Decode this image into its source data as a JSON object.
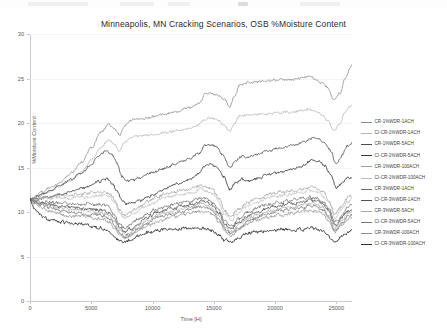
{
  "chart_data": {
    "type": "line",
    "title": "Minneapolis, MN Cracking Scenarios, OSB %Moisture Content",
    "xlabel": "Time [H]",
    "ylabel": "%Moisture Content",
    "xlim": [
      0,
      26280
    ],
    "ylim": [
      0,
      30
    ],
    "xticks": [
      0,
      5000,
      10000,
      15000,
      20000,
      25000
    ],
    "yticks": [
      0,
      5,
      10,
      15,
      20,
      25,
      30
    ],
    "grid": true,
    "legend_position": "right",
    "series": [
      {
        "name": "CR-1%WDR-1ACH",
        "color": "#8a8a8a",
        "width": 0.75,
        "x": [
          0,
          500,
          1000,
          1800,
          2600,
          3400,
          4200,
          5000,
          5800,
          6400,
          6900,
          7300,
          7700,
          8100,
          8600,
          9200,
          10000,
          11000,
          12000,
          13000,
          13800,
          14300,
          14800,
          15300,
          15800,
          16300,
          16700,
          17100,
          17600,
          18200,
          19000,
          20000,
          21000,
          22000,
          22800,
          23300,
          23800,
          24300,
          24800,
          25300,
          25700,
          26100,
          26280
        ],
        "values": [
          11.4,
          11.8,
          12.2,
          12.8,
          13.5,
          14.4,
          15.6,
          17.2,
          19.0,
          19.8,
          19.3,
          18.6,
          19.6,
          20.2,
          20.4,
          20.5,
          20.7,
          21.0,
          21.3,
          21.7,
          22.2,
          23.2,
          23.4,
          23.2,
          22.6,
          21.9,
          23.0,
          24.2,
          24.5,
          24.6,
          24.7,
          24.8,
          24.9,
          25.0,
          25.2,
          24.9,
          24.5,
          23.9,
          22.6,
          23.4,
          25.0,
          26.1,
          26.5
        ]
      },
      {
        "name": "CI-CR-1%WDR-1ACH",
        "color": "#b4b4b4",
        "width": 0.75,
        "x": [
          0,
          500,
          1000,
          1800,
          2600,
          3400,
          4200,
          5000,
          5800,
          6400,
          6900,
          7300,
          7700,
          8100,
          8600,
          9200,
          10000,
          11000,
          12000,
          13000,
          13800,
          14300,
          14800,
          15300,
          15800,
          16300,
          16700,
          17100,
          17600,
          18200,
          19000,
          20000,
          21000,
          22000,
          22800,
          23300,
          23800,
          24300,
          24800,
          25300,
          25700,
          26100,
          26280
        ],
        "values": [
          11.4,
          11.7,
          12.0,
          12.4,
          13.0,
          13.6,
          14.5,
          15.8,
          17.3,
          18.1,
          17.6,
          16.9,
          17.7,
          18.3,
          18.5,
          18.6,
          18.7,
          18.9,
          19.1,
          19.4,
          19.8,
          20.4,
          20.6,
          20.4,
          19.8,
          19.1,
          19.9,
          20.7,
          20.9,
          21.0,
          21.0,
          21.1,
          21.2,
          21.3,
          21.6,
          21.3,
          20.9,
          20.3,
          19.2,
          20.0,
          21.2,
          21.9,
          22.1
        ]
      },
      {
        "name": "CR-1%WDR-5ACH",
        "color": "#4d4d4d",
        "width": 0.8,
        "x": [
          0,
          500,
          1000,
          1800,
          2600,
          3400,
          4200,
          5000,
          5600,
          6200,
          6700,
          7100,
          7500,
          7900,
          8400,
          9000,
          10000,
          11000,
          12000,
          13000,
          13800,
          14300,
          14800,
          15300,
          15800,
          16300,
          16800,
          17300,
          17900,
          18600,
          19500,
          20500,
          21500,
          22400,
          23000,
          23500,
          24000,
          24500,
          25000,
          25500,
          25900,
          26280
        ],
        "values": [
          11.4,
          11.7,
          12.0,
          12.5,
          13.1,
          13.7,
          14.4,
          15.3,
          16.2,
          16.9,
          16.5,
          15.4,
          14.0,
          13.5,
          13.6,
          13.9,
          14.4,
          15.0,
          15.5,
          16.0,
          16.6,
          17.5,
          17.6,
          17.2,
          16.3,
          15.0,
          15.8,
          16.3,
          16.2,
          16.5,
          16.9,
          17.2,
          17.5,
          17.9,
          18.4,
          18.3,
          17.9,
          17.0,
          15.3,
          16.4,
          17.4,
          17.7
        ]
      },
      {
        "name": "CI-CR-1%WDR-5ACH",
        "color": "#3a3a3a",
        "width": 0.85,
        "x": [
          0,
          500,
          1000,
          1800,
          2600,
          3400,
          4200,
          5000,
          5600,
          6200,
          6700,
          7100,
          7500,
          7900,
          8400,
          9000,
          10000,
          11000,
          12000,
          13000,
          13800,
          14300,
          14800,
          15300,
          15800,
          16300,
          16800,
          17300,
          17900,
          18600,
          19500,
          20500,
          21500,
          22400,
          23000,
          23500,
          24000,
          24500,
          25000,
          25500,
          25900,
          26280
        ],
        "values": [
          11.4,
          11.5,
          11.6,
          11.8,
          12.0,
          12.3,
          12.6,
          13.0,
          13.4,
          13.7,
          13.3,
          12.4,
          11.3,
          10.9,
          11.0,
          11.3,
          11.9,
          12.6,
          13.2,
          13.7,
          14.3,
          15.2,
          15.3,
          14.9,
          14.0,
          12.6,
          13.3,
          13.7,
          13.5,
          13.8,
          14.2,
          14.5,
          14.9,
          15.3,
          15.8,
          15.7,
          15.3,
          14.4,
          12.7,
          13.3,
          13.8,
          13.9
        ]
      },
      {
        "name": "CR-1%WDR-100ACH",
        "color": "#9d9d9d",
        "width": 0.7,
        "x": [
          0,
          400,
          900,
          1600,
          2400,
          3200,
          4000,
          4800,
          5400,
          6000,
          6500,
          6900,
          7300,
          7700,
          8200,
          8800,
          9600,
          10500,
          11500,
          12500,
          13300,
          13900,
          14400,
          14900,
          15400,
          15900,
          16400,
          17000,
          17700,
          18500,
          19400,
          20400,
          21400,
          22300,
          22900,
          23400,
          23900,
          24400,
          24900,
          25400,
          25900,
          26280
        ],
        "values": [
          11.4,
          11.5,
          11.6,
          11.7,
          11.8,
          11.9,
          12.0,
          12.1,
          12.2,
          12.3,
          12.1,
          11.4,
          10.3,
          9.6,
          9.9,
          10.5,
          11.2,
          11.8,
          12.2,
          12.5,
          12.7,
          13.0,
          12.9,
          12.5,
          11.6,
          10.2,
          9.5,
          10.3,
          11.0,
          11.5,
          11.9,
          12.2,
          12.4,
          12.6,
          12.8,
          12.7,
          12.3,
          11.4,
          9.8,
          10.6,
          11.5,
          11.9
        ]
      },
      {
        "name": "CI-CR-1%WDR-100ACH",
        "color": "#bcbcbc",
        "width": 0.7,
        "x": [
          0,
          400,
          900,
          1600,
          2400,
          3200,
          4000,
          4800,
          5400,
          6000,
          6500,
          6900,
          7300,
          7700,
          8200,
          8800,
          9600,
          10500,
          11500,
          12500,
          13300,
          13900,
          14400,
          14900,
          15400,
          15900,
          16400,
          17000,
          17700,
          18500,
          19400,
          20400,
          21400,
          22300,
          22900,
          23400,
          23900,
          24400,
          24900,
          25400,
          25900,
          26280
        ],
        "values": [
          11.4,
          11.4,
          11.5,
          11.5,
          11.6,
          11.6,
          11.7,
          11.7,
          11.8,
          11.9,
          11.7,
          11.0,
          9.9,
          9.2,
          9.5,
          10.1,
          10.8,
          11.4,
          11.8,
          12.0,
          12.2,
          12.5,
          12.4,
          12.0,
          11.1,
          9.7,
          9.1,
          9.9,
          10.6,
          11.1,
          11.5,
          11.8,
          12.0,
          12.2,
          12.4,
          12.3,
          11.9,
          11.0,
          9.4,
          10.2,
          11.1,
          11.5
        ]
      },
      {
        "name": "CR-3%WDR-1ACH",
        "color": "#6e6e6e",
        "width": 0.75,
        "x": [
          0,
          400,
          900,
          1600,
          2400,
          3200,
          4000,
          4800,
          5400,
          6000,
          6500,
          6900,
          7300,
          7700,
          8200,
          8800,
          9600,
          10500,
          11500,
          12500,
          13300,
          13900,
          14400,
          14900,
          15400,
          15900,
          16400,
          17000,
          17700,
          18500,
          19400,
          20400,
          21400,
          22300,
          22900,
          23400,
          23900,
          24400,
          24900,
          25400,
          25900,
          26280
        ],
        "values": [
          11.4,
          11.3,
          11.2,
          11.1,
          11.0,
          11.0,
          10.9,
          10.9,
          10.8,
          10.8,
          10.5,
          9.7,
          8.7,
          8.2,
          8.5,
          9.1,
          9.8,
          10.4,
          10.8,
          11.1,
          11.3,
          11.6,
          11.5,
          11.1,
          10.3,
          9.0,
          8.4,
          9.2,
          9.9,
          10.4,
          10.8,
          11.1,
          11.3,
          11.5,
          11.7,
          11.6,
          11.2,
          10.3,
          8.8,
          9.5,
          10.4,
          10.8
        ]
      },
      {
        "name": "CI-CR-3%WDR-1ACH",
        "color": "#505050",
        "width": 0.8,
        "x": [
          0,
          400,
          900,
          1600,
          2400,
          3200,
          4000,
          4800,
          5400,
          6000,
          6500,
          6900,
          7300,
          7700,
          8200,
          8800,
          9600,
          10500,
          11500,
          12500,
          13300,
          13900,
          14400,
          14900,
          15400,
          15900,
          16400,
          17000,
          17700,
          18500,
          19400,
          20400,
          21400,
          22300,
          22900,
          23400,
          23900,
          24400,
          24900,
          25400,
          25900,
          26280
        ],
        "values": [
          11.4,
          11.2,
          11.0,
          10.8,
          10.6,
          10.5,
          10.4,
          10.3,
          10.2,
          10.2,
          9.9,
          9.2,
          8.3,
          7.8,
          8.1,
          8.7,
          9.4,
          10.0,
          10.4,
          10.7,
          10.9,
          11.2,
          11.1,
          10.7,
          9.9,
          8.7,
          8.1,
          8.8,
          9.5,
          10.0,
          10.4,
          10.7,
          10.9,
          11.1,
          11.3,
          11.2,
          10.8,
          9.9,
          8.5,
          9.2,
          10.0,
          10.4
        ]
      },
      {
        "name": "CR-3%WDR-5ACH",
        "color": "#a8a8a8",
        "width": 0.7,
        "x": [
          0,
          400,
          900,
          1600,
          2400,
          3200,
          4000,
          4800,
          5400,
          6000,
          6500,
          6900,
          7300,
          7700,
          8200,
          8800,
          9600,
          10500,
          11500,
          12500,
          13300,
          13900,
          14400,
          14900,
          15400,
          15900,
          16400,
          17000,
          17700,
          18500,
          19400,
          20400,
          21400,
          22300,
          22900,
          23400,
          23900,
          24400,
          24900,
          25400,
          25900,
          26280
        ],
        "values": [
          11.4,
          11.2,
          11.0,
          10.7,
          10.5,
          10.3,
          10.2,
          10.1,
          10.0,
          9.9,
          9.6,
          8.8,
          7.9,
          7.5,
          7.8,
          8.4,
          9.1,
          9.7,
          10.1,
          10.4,
          10.6,
          10.9,
          10.8,
          10.4,
          9.6,
          8.4,
          7.8,
          8.5,
          9.2,
          9.7,
          10.1,
          10.4,
          10.6,
          10.8,
          11.0,
          10.9,
          10.5,
          9.6,
          8.2,
          8.9,
          9.7,
          10.1
        ]
      },
      {
        "name": "CI-CR-3%WDR-5ACH",
        "color": "#777777",
        "width": 0.75,
        "x": [
          0,
          400,
          900,
          1600,
          2400,
          3200,
          4000,
          4800,
          5400,
          6000,
          6500,
          6900,
          7300,
          7700,
          8200,
          8800,
          9600,
          10500,
          11500,
          12500,
          13300,
          13900,
          14400,
          14900,
          15400,
          15900,
          16400,
          17000,
          17700,
          18500,
          19400,
          20400,
          21400,
          22300,
          22900,
          23400,
          23900,
          24400,
          24900,
          25400,
          25900,
          26280
        ],
        "values": [
          11.4,
          11.1,
          10.8,
          10.5,
          10.2,
          10.0,
          9.9,
          9.8,
          9.7,
          9.6,
          9.3,
          8.5,
          7.6,
          7.2,
          7.5,
          8.1,
          8.8,
          9.4,
          9.8,
          10.1,
          10.3,
          10.6,
          10.5,
          10.1,
          9.3,
          8.1,
          7.5,
          8.2,
          8.9,
          9.4,
          9.8,
          10.1,
          10.3,
          10.5,
          10.7,
          10.6,
          10.2,
          9.3,
          7.9,
          8.6,
          9.4,
          9.8
        ]
      },
      {
        "name": "CR-3%WDR-100ACH",
        "color": "#8e8e8e",
        "width": 0.7,
        "x": [
          0,
          400,
          900,
          1600,
          2400,
          3200,
          4000,
          4800,
          5400,
          6000,
          6500,
          6900,
          7300,
          7700,
          8200,
          8800,
          9600,
          10500,
          11500,
          12500,
          13300,
          13900,
          14400,
          14900,
          15400,
          15900,
          16400,
          17000,
          17700,
          18500,
          19400,
          20400,
          21400,
          22300,
          22900,
          23400,
          23900,
          24400,
          24900,
          25400,
          25900,
          26280
        ],
        "values": [
          11.4,
          10.9,
          10.5,
          10.1,
          9.8,
          9.6,
          9.5,
          9.4,
          9.3,
          9.2,
          8.9,
          8.2,
          7.4,
          7.0,
          7.3,
          7.9,
          8.5,
          9.0,
          9.4,
          9.7,
          9.9,
          10.1,
          10.0,
          9.7,
          9.0,
          7.9,
          7.3,
          8.0,
          8.6,
          9.1,
          9.4,
          9.7,
          9.9,
          10.1,
          10.2,
          10.1,
          9.8,
          9.0,
          7.7,
          8.4,
          9.1,
          9.4
        ]
      },
      {
        "name": "CI-CR-3%WDR-100ACH",
        "color": "#2e2e2e",
        "width": 0.85,
        "x": [
          0,
          300,
          700,
          1200,
          1800,
          2500,
          3200,
          4000,
          4800,
          5400,
          6000,
          6500,
          6900,
          7300,
          7700,
          8200,
          8800,
          9600,
          10500,
          11500,
          12500,
          13300,
          13900,
          14400,
          14900,
          15400,
          15900,
          16400,
          17000,
          17700,
          18500,
          19400,
          20400,
          21400,
          22300,
          22900,
          23400,
          23900,
          24400,
          24900,
          25400,
          25900,
          26280
        ],
        "values": [
          11.4,
          10.4,
          9.8,
          9.4,
          9.1,
          8.9,
          8.8,
          8.7,
          8.5,
          8.3,
          8.1,
          7.8,
          7.2,
          6.8,
          6.6,
          6.9,
          7.3,
          7.7,
          7.9,
          8.0,
          8.1,
          8.1,
          8.2,
          8.1,
          7.9,
          7.4,
          6.8,
          6.6,
          7.1,
          7.5,
          7.8,
          7.9,
          8.0,
          8.1,
          8.1,
          8.2,
          8.1,
          7.8,
          7.2,
          6.6,
          7.1,
          7.7,
          7.9
        ]
      }
    ]
  },
  "legend": {
    "items": [
      {
        "label": "CR-1%WDR-1ACH"
      },
      {
        "label": "CI-CR-1%WDR-1ACH"
      },
      {
        "label": "CR-1%WDR-5ACH"
      },
      {
        "label": "CI-CR-1%WDR-5ACH"
      },
      {
        "label": "CR-1%WDR-100ACH"
      },
      {
        "label": "CI-CR-1%WDR-100ACH"
      },
      {
        "label": "CR-3%WDR-1ACH"
      },
      {
        "label": "CI-CR-3%WDR-1ACH"
      },
      {
        "label": "CR-3%WDR-5ACH"
      },
      {
        "label": "CI-CR-3%WDR-5ACH"
      },
      {
        "label": "CR-3%WDR-100ACH"
      },
      {
        "label": "CI-CR-3%WDR-100ACH"
      }
    ]
  }
}
